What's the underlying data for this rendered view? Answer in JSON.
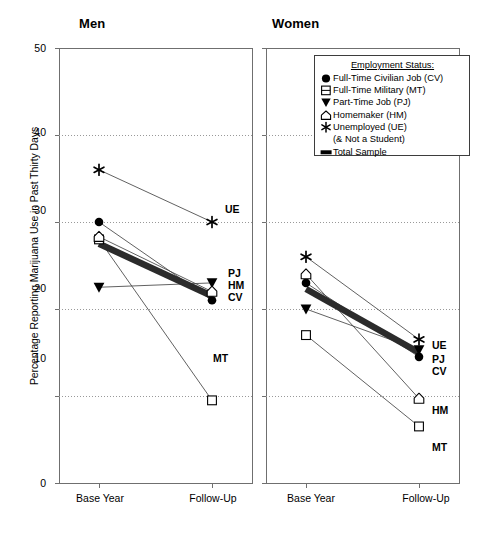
{
  "figure": {
    "ylabel": "Percentage Reporting Marijuana Use in Past Thirty Days",
    "panels": [
      {
        "key": "men",
        "title": "Men"
      },
      {
        "key": "women",
        "title": "Women"
      }
    ],
    "yticks": [
      "0",
      "10",
      "20",
      "30",
      "40",
      "50"
    ],
    "xticks": [
      "Base Year",
      "Follow-Up"
    ]
  },
  "legend": {
    "title": "Employment Status:",
    "items": [
      {
        "marker": "filled-circle-marker",
        "label": "Full-Time Civilian Job (CV)"
      },
      {
        "marker": "open-square-marker",
        "label": "Full-Time Military (MT)"
      },
      {
        "marker": "filled-triangle-down-marker",
        "label": "Part-Time Job (PJ)"
      },
      {
        "marker": "open-house-marker",
        "label": "Homemaker (HM)"
      },
      {
        "marker": "star-marker",
        "label": "Unemployed (UE)",
        "sublabel": "(& Not a Student)"
      },
      {
        "marker": "thick-bar-marker",
        "label": "Total Sample"
      }
    ]
  },
  "chart_data": {
    "type": "line",
    "xlabel": "",
    "ylabel": "Percentage Reporting Marijuana Use in Past Thirty Days",
    "x": [
      "Base Year",
      "Follow-Up"
    ],
    "ylim": [
      0,
      50
    ],
    "ytick_values": [
      0,
      10,
      20,
      30,
      40,
      50
    ],
    "grid": "horizontal-dotted",
    "legend_position": "top-right-inside-women-panel",
    "panels": [
      {
        "name": "Men",
        "series": [
          {
            "name": "Full-Time Civilian Job (CV)",
            "code": "CV",
            "marker": "filled-circle-marker",
            "values": [
              30.0,
              21.0
            ]
          },
          {
            "name": "Full-Time Military (MT)",
            "code": "MT",
            "marker": "open-square-marker",
            "values": [
              28.0,
              9.5
            ]
          },
          {
            "name": "Part-Time Job (PJ)",
            "code": "PJ",
            "marker": "filled-triangle-down-marker",
            "values": [
              22.5,
              23.0
            ]
          },
          {
            "name": "Homemaker (HM)",
            "code": "HM",
            "marker": "open-house-marker",
            "values": [
              28.3,
              22.0
            ]
          },
          {
            "name": "Unemployed (UE)",
            "code": "UE",
            "marker": "star-marker",
            "values": [
              36.0,
              30.0
            ]
          },
          {
            "name": "Total Sample",
            "code": "TS",
            "marker": "thick-bar-marker",
            "values": [
              27.5,
              21.5
            ]
          }
        ]
      },
      {
        "name": "Women",
        "series": [
          {
            "name": "Full-Time Civilian Job (CV)",
            "code": "CV",
            "marker": "filled-circle-marker",
            "values": [
              23.0,
              14.5
            ]
          },
          {
            "name": "Full-Time Military (MT)",
            "code": "MT",
            "marker": "open-square-marker",
            "values": [
              17.0,
              6.5
            ]
          },
          {
            "name": "Part-Time Job (PJ)",
            "code": "PJ",
            "marker": "filled-triangle-down-marker",
            "values": [
              20.0,
              15.3
            ]
          },
          {
            "name": "Homemaker (HM)",
            "code": "HM",
            "marker": "open-house-marker",
            "values": [
              24.0,
              9.7
            ]
          },
          {
            "name": "Unemployed (UE)",
            "code": "UE",
            "marker": "star-marker",
            "values": [
              26.0,
              16.5
            ]
          },
          {
            "name": "Total Sample",
            "code": "TS",
            "marker": "thick-bar-marker",
            "values": [
              22.3,
              15.0
            ]
          }
        ]
      }
    ],
    "point_labels": {
      "men": [
        "UE",
        "PJ",
        "HM",
        "CV",
        "MT"
      ],
      "women": [
        "UE",
        "PJ",
        "CV",
        "HM",
        "MT"
      ]
    }
  }
}
